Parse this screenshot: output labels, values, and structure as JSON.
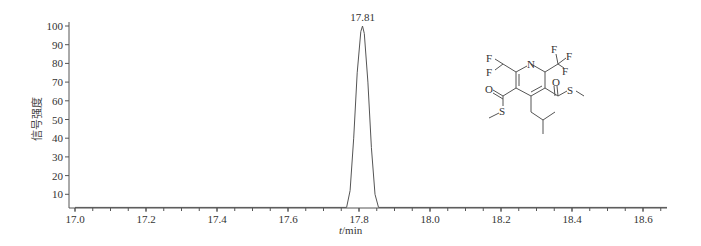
{
  "chart_data": {
    "type": "line",
    "title": "",
    "xlabel_var": "t",
    "xlabel_unit": "/min",
    "xlabel": "t/min",
    "ylabel": "信号强度",
    "xlim": [
      17.0,
      18.67
    ],
    "ylim": [
      3,
      100
    ],
    "x_ticks": [
      17.0,
      17.2,
      17.4,
      17.6,
      17.8,
      18.0,
      18.2,
      18.4,
      18.6
    ],
    "x_tick_labels": [
      "17.0",
      "17.2",
      "17.4",
      "17.6",
      "17.8",
      "18.0",
      "18.2",
      "18.4",
      "18.6"
    ],
    "x_minor_step": 0.05,
    "y_ticks": [
      10,
      20,
      30,
      40,
      50,
      60,
      70,
      80,
      90,
      100
    ],
    "y_tick_labels": [
      "10",
      "20",
      "30",
      "40",
      "50",
      "60",
      "70",
      "80",
      "90",
      "100"
    ],
    "grid": false,
    "legend": null,
    "series": [
      {
        "name": "chromatogram",
        "x": [
          17.0,
          17.765,
          17.775,
          17.785,
          17.795,
          17.805,
          17.81,
          17.815,
          17.825,
          17.835,
          17.845,
          17.855,
          18.67
        ],
        "y": [
          3,
          3,
          12,
          40,
          75,
          97,
          100,
          96,
          70,
          35,
          10,
          3,
          3
        ]
      }
    ],
    "annotations": [
      {
        "text": "17.81",
        "x": 17.81,
        "y": 100,
        "type": "peak-label"
      }
    ],
    "inset": {
      "type": "chemical-structure",
      "description": "2-(difluoromethyl)-4-isobutyl-6-(trifluoromethyl)pyridine-3,5-dicarbothioic acid S,S-dimethyl ester",
      "atom_labels": [
        "N",
        "F",
        "F",
        "F",
        "F",
        "F",
        "O",
        "O",
        "S",
        "S"
      ]
    }
  },
  "colors": {
    "line": "#555555",
    "axis": "#555555",
    "text": "#333333",
    "structure": "#555555"
  }
}
